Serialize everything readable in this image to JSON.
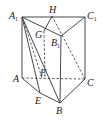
{
  "figure": {
    "type": "triangular-prism",
    "vertices": {
      "A1": {
        "label": "A",
        "sub": "1",
        "x": 22,
        "y": 17
      },
      "H": {
        "label": "H",
        "sub": "",
        "x": 52,
        "y": 16
      },
      "C1": {
        "label": "C",
        "sub": "1",
        "x": 85,
        "y": 17
      },
      "G": {
        "label": "G",
        "sub": "",
        "x": 44,
        "y": 31
      },
      "B1": {
        "label": "B",
        "sub": "1",
        "x": 61,
        "y": 36
      },
      "A": {
        "label": "A",
        "sub": "",
        "x": 22,
        "y": 78
      },
      "F": {
        "label": "F",
        "sub": "",
        "x": 45,
        "y": 78
      },
      "C": {
        "label": "C",
        "sub": "",
        "x": 85,
        "y": 79
      },
      "E": {
        "label": "E",
        "sub": "",
        "x": 40,
        "y": 93
      },
      "B": {
        "label": "B",
        "sub": "",
        "x": 60,
        "y": 103
      }
    },
    "labels": {
      "A1": "A",
      "A1_sub": "1",
      "H": "H",
      "C1": "C",
      "C1_sub": "1",
      "G": "G",
      "B1": "B",
      "B1_sub": "1",
      "A": "A",
      "F": "F",
      "C": "C",
      "E": "E",
      "B": "B"
    },
    "solid_edges": [
      [
        "A1",
        "C1"
      ],
      [
        "A1",
        "B1"
      ],
      [
        "B1",
        "C1"
      ],
      [
        "A1",
        "A"
      ],
      [
        "C1",
        "C"
      ],
      [
        "B1",
        "B"
      ],
      [
        "A",
        "E"
      ],
      [
        "E",
        "B"
      ],
      [
        "B",
        "C"
      ],
      [
        "A1",
        "E"
      ],
      [
        "G",
        "H"
      ],
      [
        "A1",
        "B"
      ]
    ],
    "dashed_edges": [
      [
        "A",
        "C"
      ],
      [
        "H",
        "C"
      ],
      [
        "G",
        "F"
      ],
      [
        "A1",
        "F"
      ]
    ]
  }
}
